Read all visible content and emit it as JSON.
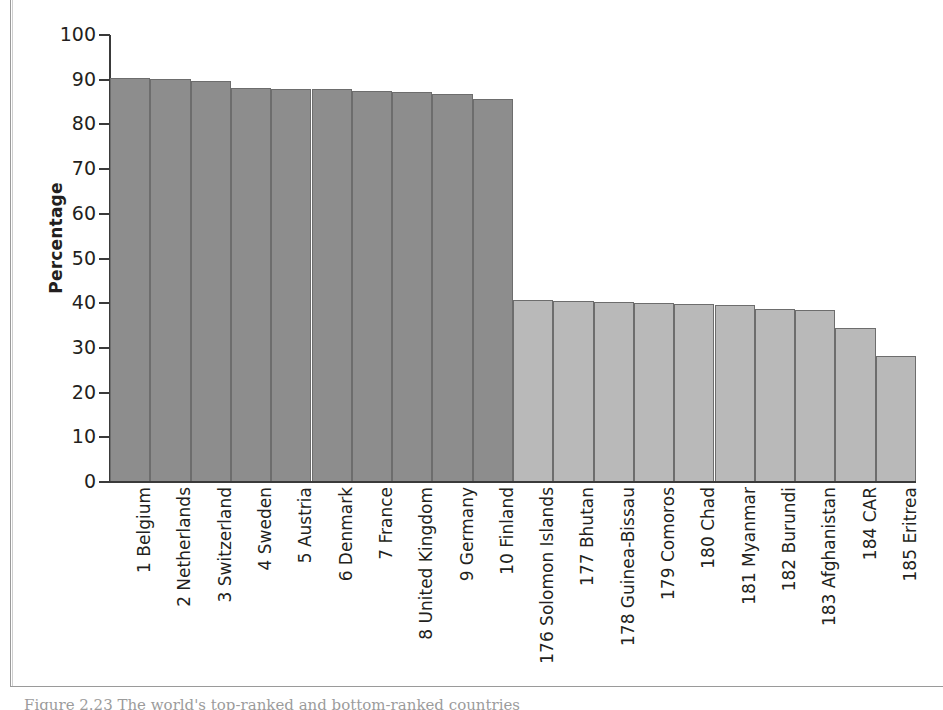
{
  "chart_data": {
    "type": "bar",
    "title": "",
    "xlabel": "",
    "ylabel": "Percentage",
    "ylim": [
      0,
      100
    ],
    "ytick_values": [
      0,
      10,
      20,
      30,
      40,
      50,
      60,
      70,
      80,
      90,
      100
    ],
    "ytick_labels": [
      "0",
      "10",
      "20",
      "30",
      "40",
      "50",
      "60",
      "70",
      "80",
      "90",
      "100"
    ],
    "grid": false,
    "legend": "none",
    "categories": [
      "1 Belgium",
      "2 Netherlands",
      "3 Switzerland",
      "4 Sweden",
      "5 Austria",
      "6 Denmark",
      "7 France",
      "8 United Kingdom",
      "9 Germany",
      "10 Finland",
      "176 Solomon Islands",
      "177 Bhutan",
      "178 Guinea-Bissau",
      "179 Comoros",
      "180 Chad",
      "181 Myanmar",
      "182 Burundi",
      "183 Afghanistan",
      "184 CAR",
      "185 Eritrea"
    ],
    "values": [
      90.3,
      90.1,
      89.7,
      88.1,
      87.9,
      87.9,
      87.4,
      87.2,
      86.7,
      85.7,
      40.8,
      40.6,
      40.2,
      40.0,
      39.9,
      39.5,
      38.8,
      38.4,
      34.5,
      28.3
    ],
    "bar_groups": [
      {
        "name": "top-ranked",
        "color": "#8d8d8d",
        "indices": [
          0,
          1,
          2,
          3,
          4,
          5,
          6,
          7,
          8,
          9
        ]
      },
      {
        "name": "bottom-ranked",
        "color": "#b9b9b9",
        "indices": [
          10,
          11,
          12,
          13,
          14,
          15,
          16,
          17,
          18,
          19
        ]
      }
    ],
    "bar_edge_color": "#6d6d6d",
    "axis_color": "#3a3a3a"
  },
  "caption": {
    "text": "Figure 2.23 The world's top-ranked and bottom-ranked countries"
  }
}
